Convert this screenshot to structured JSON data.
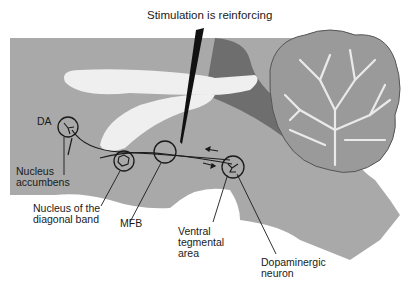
{
  "diagram": {
    "title": "Stimulation is reinforcing",
    "labels": {
      "da": "DA",
      "nucleus_accumbens": "Nucleus\naccumbens",
      "nucleus_diagonal_band": "Nucleus of the\ndiagonal band",
      "mfb": "MFB",
      "ventral_tegmental_area": "Ventral\ntegmental\narea",
      "dopaminergic_neuron": "Dopaminergic\nneuron"
    },
    "colors": {
      "brain_fill": "#a9a9a9",
      "dark_region": "#6e6e6e",
      "ventricle": "#efefef",
      "line": "#1a1a1a",
      "electrode": "#111111"
    }
  }
}
